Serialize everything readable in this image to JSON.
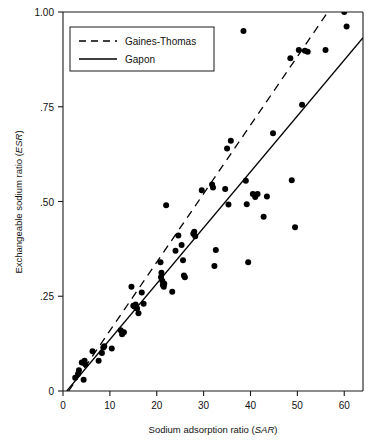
{
  "chart_data": {
    "type": "scatter",
    "title": "",
    "xlabel": "Sodium adsorption ratio (SAR)",
    "xlabel_plain": "Sodium adsorption ratio (",
    "xlabel_italic": "SAR",
    "xlabel_tail": ")",
    "ylabel": "Exchangeable sodium ratio (ESR)",
    "ylabel_plain": "Exchangeable sodium ratio (",
    "ylabel_italic": "ESR",
    "ylabel_tail": ")",
    "xlim": [
      0,
      64
    ],
    "ylim": [
      0,
      1.0
    ],
    "xticks": [
      0,
      10,
      20,
      30,
      40,
      50,
      60
    ],
    "xticklabels": [
      "0",
      "10",
      "20",
      "30",
      "40",
      "50",
      "60"
    ],
    "yticks": [
      0,
      0.25,
      0.5,
      0.75,
      1.0
    ],
    "yticklabels": [
      "0",
      ".25",
      ".50",
      ".75",
      "1.00"
    ],
    "grid": false,
    "marker_color": "#000000",
    "marker_size": 3.0,
    "points": [
      [
        2.6,
        0.035
      ],
      [
        3.2,
        0.045
      ],
      [
        3.4,
        0.055
      ],
      [
        4.0,
        0.075
      ],
      [
        4.3,
        0.075
      ],
      [
        4.6,
        0.08
      ],
      [
        4.8,
        0.07
      ],
      [
        4.4,
        0.03
      ],
      [
        6.3,
        0.105
      ],
      [
        7.6,
        0.08
      ],
      [
        8.3,
        0.1
      ],
      [
        8.6,
        0.115
      ],
      [
        8.8,
        0.118
      ],
      [
        10.4,
        0.112
      ],
      [
        12.3,
        0.16
      ],
      [
        12.6,
        0.15
      ],
      [
        13.0,
        0.155
      ],
      [
        14.6,
        0.275
      ],
      [
        15.0,
        0.225
      ],
      [
        15.3,
        0.222
      ],
      [
        15.5,
        0.228
      ],
      [
        15.8,
        0.218
      ],
      [
        16.1,
        0.205
      ],
      [
        16.8,
        0.26
      ],
      [
        17.2,
        0.23
      ],
      [
        20.8,
        0.34
      ],
      [
        20.9,
        0.3
      ],
      [
        21.0,
        0.312
      ],
      [
        21.2,
        0.29
      ],
      [
        21.3,
        0.28
      ],
      [
        21.5,
        0.275
      ],
      [
        21.6,
        0.283
      ],
      [
        22.0,
        0.49
      ],
      [
        23.3,
        0.262
      ],
      [
        24.0,
        0.37
      ],
      [
        24.6,
        0.41
      ],
      [
        25.3,
        0.385
      ],
      [
        25.6,
        0.345
      ],
      [
        25.8,
        0.305
      ],
      [
        26.0,
        0.3
      ],
      [
        27.8,
        0.415
      ],
      [
        28.0,
        0.42
      ],
      [
        28.2,
        0.408
      ],
      [
        29.6,
        0.53
      ],
      [
        31.8,
        0.545
      ],
      [
        32.0,
        0.537
      ],
      [
        32.3,
        0.33
      ],
      [
        32.6,
        0.372
      ],
      [
        34.6,
        0.533
      ],
      [
        35.0,
        0.64
      ],
      [
        35.3,
        0.492
      ],
      [
        35.8,
        0.66
      ],
      [
        38.5,
        0.95
      ],
      [
        39.0,
        0.555
      ],
      [
        39.2,
        0.493
      ],
      [
        39.5,
        0.34
      ],
      [
        40.5,
        0.52
      ],
      [
        41.0,
        0.512
      ],
      [
        41.5,
        0.52
      ],
      [
        42.8,
        0.46
      ],
      [
        43.5,
        0.513
      ],
      [
        44.8,
        0.68
      ],
      [
        48.5,
        0.878
      ],
      [
        48.8,
        0.556
      ],
      [
        49.5,
        0.432
      ],
      [
        50.3,
        0.9
      ],
      [
        51.0,
        0.755
      ],
      [
        51.6,
        0.898
      ],
      [
        52.2,
        0.895
      ],
      [
        56.0,
        0.9
      ],
      [
        60.0,
        1.0
      ],
      [
        60.5,
        0.962
      ]
    ],
    "series_lines": [
      {
        "name": "Gaines-Thomas",
        "style": "dashed",
        "color": "#000000",
        "x": [
          1.2,
          56.5
        ],
        "y": [
          0.0,
          1.0
        ]
      },
      {
        "name": "Gapon",
        "style": "solid",
        "color": "#000000",
        "x": [
          0.8,
          64.0
        ],
        "y": [
          0.0,
          0.932
        ]
      }
    ],
    "legend": {
      "position": "upper-left-inside",
      "entries": [
        {
          "label": "Gaines-Thomas",
          "style": "dashed"
        },
        {
          "label": "Gapon",
          "style": "solid"
        }
      ]
    }
  }
}
